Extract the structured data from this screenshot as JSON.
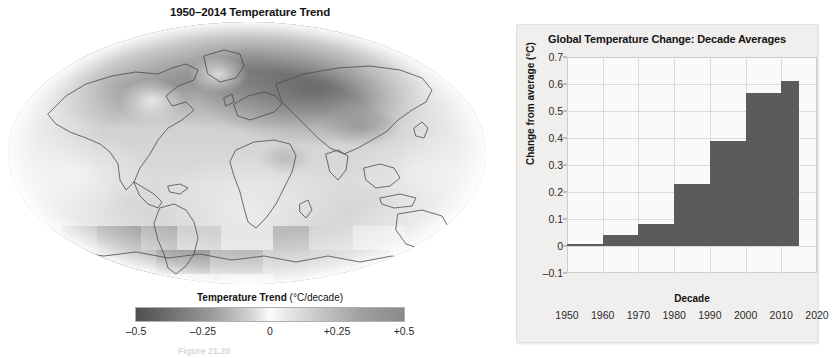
{
  "map": {
    "title": "1950–2014 Temperature Trend",
    "legend": {
      "title_strong": "Temperature Trend",
      "title_unit": "(°C/decade)",
      "ticks": [
        "–0.5",
        "–0.25",
        "0",
        "+0.25",
        "+0.5"
      ],
      "tick_positions": [
        0.0,
        0.25,
        0.5,
        0.75,
        1.0
      ],
      "gradient_low_color": "#4f4f4f",
      "gradient_mid_color": "#fbfbfb",
      "gradient_high_color": "#8a8a8a"
    },
    "projection": "robinson"
  },
  "caption": {
    "text": "Figure 21.20"
  },
  "chart_data": {
    "type": "bar",
    "title": "Global Temperature Change: Decade Averages",
    "xlabel": "Decade",
    "ylabel": "Change from average (°C)",
    "categories": [
      "1950",
      "1960",
      "1970",
      "1980",
      "1990",
      "2000",
      "2010"
    ],
    "values": [
      0.0,
      0.04,
      0.08,
      0.23,
      0.39,
      0.565,
      0.61
    ],
    "bar_start_years": [
      1950,
      1960,
      1970,
      1980,
      1990,
      2000,
      2010
    ],
    "bar_end_years": [
      1960,
      1970,
      1980,
      1990,
      2000,
      2010,
      2015
    ],
    "xlim": [
      1950,
      2020
    ],
    "ylim": [
      -0.1,
      0.7
    ],
    "xticks": [
      "1950",
      "1960",
      "1970",
      "1980",
      "1990",
      "2000",
      "2010",
      "2020"
    ],
    "xtick_values": [
      1950,
      1960,
      1970,
      1980,
      1990,
      2000,
      2010,
      2020
    ],
    "yticks": [
      "0.7",
      "0.6",
      "0.5",
      "0.4",
      "0.3",
      "0.2",
      "0.1",
      "0",
      "–0.1"
    ],
    "ytick_values": [
      0.7,
      0.6,
      0.5,
      0.4,
      0.3,
      0.2,
      0.1,
      0.0,
      -0.1
    ],
    "grid": true,
    "legend": false,
    "bar_color": "#5b5b5b",
    "panel_background": "#f1efed",
    "plot_background": "#fbfafa",
    "grid_color": "#ddd9d6"
  }
}
